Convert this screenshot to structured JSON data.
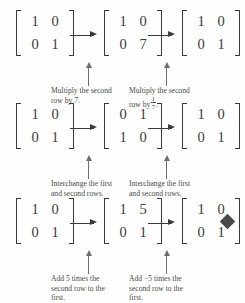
{
  "figure": {
    "top_remnant": "·  ·",
    "qed_marker": "filled-diamond",
    "rows": [
      {
        "id": "row-multiply",
        "matrices": [
          {
            "name": "identity-2x2",
            "cells": [
              "1",
              "0",
              "0",
              "1"
            ]
          },
          {
            "name": "scaled-row2-by-7",
            "cells": [
              "1",
              "0",
              "0",
              "7"
            ]
          },
          {
            "name": "identity-2x2",
            "cells": [
              "1",
              "0",
              "0",
              "1"
            ]
          }
        ],
        "captions": [
          {
            "line1": "Multiply the second",
            "line2_pre": "row by 7.",
            "fraction": null
          },
          {
            "line1": "Multiply the second",
            "line2_pre": "row by",
            "fraction": {
              "num": "1",
              "den": "7"
            },
            "line2_post": "."
          }
        ]
      },
      {
        "id": "row-interchange",
        "matrices": [
          {
            "name": "identity-2x2",
            "cells": [
              "1",
              "0",
              "0",
              "1"
            ]
          },
          {
            "name": "swapped-rows",
            "cells": [
              "0",
              "1",
              "1",
              "0"
            ]
          },
          {
            "name": "identity-2x2",
            "cells": [
              "1",
              "0",
              "0",
              "1"
            ]
          }
        ],
        "captions": [
          {
            "line1": "Interchange the first",
            "line2_pre": "and second rows.",
            "fraction": null
          },
          {
            "line1": "Interchange the first",
            "line2_pre": "and second rows.",
            "fraction": null
          }
        ]
      },
      {
        "id": "row-add-multiple",
        "matrices": [
          {
            "name": "identity-2x2",
            "cells": [
              "1",
              "0",
              "0",
              "1"
            ]
          },
          {
            "name": "shear-plus-5",
            "cells": [
              "1",
              "5",
              "0",
              "1"
            ]
          },
          {
            "name": "identity-2x2",
            "cells": [
              "1",
              "0",
              "0",
              "1"
            ]
          }
        ],
        "captions": [
          {
            "line1": "Add 5 times the",
            "line2_pre": "second row to the",
            "line3": "first.",
            "fraction": null
          },
          {
            "line1": "Add −5 times the",
            "line2_pre": "second row to the",
            "line3": "first.",
            "fraction": null
          }
        ]
      }
    ],
    "icons": {
      "right_arrow": "→",
      "up_arrow": "↑"
    },
    "colors": {
      "ink": "#3b3b3b",
      "caption_ink": "#4a4a4a",
      "arrow_ink": "#6d6d6d",
      "background": "#fefefe"
    }
  }
}
